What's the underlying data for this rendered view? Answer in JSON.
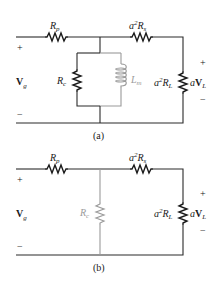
{
  "figure": {
    "panels": [
      {
        "caption": "(a)",
        "source": {
          "label_main": "V",
          "label_sub": "g",
          "plus": "+",
          "minus": "−"
        },
        "series_resistor_1": {
          "label_main": "R",
          "label_sub": "p"
        },
        "series_resistor_2": {
          "label_prefix": "a",
          "label_sup": "2",
          "label_main": "R",
          "label_sub": "s"
        },
        "shunt_resistor": {
          "label_main": "R",
          "label_sub": "c",
          "color": "#1a1a1a"
        },
        "shunt_inductor": {
          "label_main": "L",
          "label_sub": "m",
          "color": "#9a9a9a"
        },
        "load_resistor": {
          "label_prefix": "a",
          "label_sup": "2",
          "label_main": "R",
          "label_sub": "L"
        },
        "load_voltage": {
          "label_prefix": "a",
          "label_main": "V",
          "label_sub": "L",
          "plus": "+",
          "minus": "−"
        }
      },
      {
        "caption": "(b)",
        "source": {
          "label_main": "V",
          "label_sub": "g",
          "plus": "+",
          "minus": "−"
        },
        "series_resistor_1": {
          "label_main": "R",
          "label_sub": "p"
        },
        "series_resistor_2": {
          "label_prefix": "a",
          "label_sup": "2",
          "label_main": "R",
          "label_sub": "s"
        },
        "shunt_resistor": {
          "label_main": "R",
          "label_sub": "c",
          "color": "#9a9a9a"
        },
        "load_resistor": {
          "label_prefix": "a",
          "label_sup": "2",
          "label_main": "R",
          "label_sub": "L"
        },
        "load_voltage": {
          "label_prefix": "a",
          "label_main": "V",
          "label_sub": "L",
          "plus": "+",
          "minus": "−"
        }
      }
    ],
    "colors": {
      "wire": "#2a2a2a",
      "deemphasized": "#9a9a9a",
      "background": "#ffffff"
    }
  }
}
